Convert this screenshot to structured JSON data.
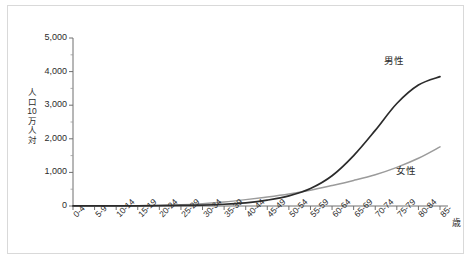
{
  "chart_data": {
    "type": "line",
    "title": "",
    "subtitle": "",
    "xlabel": "歳",
    "ylabel": "人口10万人対",
    "ylabel_chars": [
      "人",
      "口",
      "10",
      "万",
      "人",
      "対"
    ],
    "categories": [
      "0-4",
      "5-9",
      "10-14",
      "15-19",
      "20-24",
      "25-29",
      "30-34",
      "35-39",
      "40-44",
      "45-49",
      "50-54",
      "55-59",
      "60-64",
      "65-69",
      "70-74",
      "75-79",
      "80-84",
      "85-"
    ],
    "ylim": [
      0,
      5000
    ],
    "ytick_labels": [
      "0",
      "1,000",
      "2,000",
      "3,000",
      "4,000",
      "5,000"
    ],
    "ytick_values": [
      0,
      1000,
      2000,
      3000,
      4000,
      5000
    ],
    "yminor_step": 500,
    "grid": false,
    "legend_position": "inline-right",
    "series": [
      {
        "name": "男性",
        "color": "#2b2b2b",
        "values": [
          2,
          3,
          4,
          6,
          9,
          16,
          28,
          52,
          95,
          175,
          300,
          520,
          900,
          1500,
          2250,
          3050,
          3600,
          3850
        ]
      },
      {
        "name": "女性",
        "color": "#9b9b9b",
        "values": [
          2,
          3,
          5,
          8,
          16,
          35,
          70,
          120,
          190,
          270,
          360,
          470,
          610,
          760,
          930,
          1150,
          1420,
          1760
        ]
      }
    ],
    "annotations": [
      {
        "name": "male-series-label",
        "text": "男性"
      },
      {
        "name": "female-series-label",
        "text": "女性"
      }
    ]
  }
}
